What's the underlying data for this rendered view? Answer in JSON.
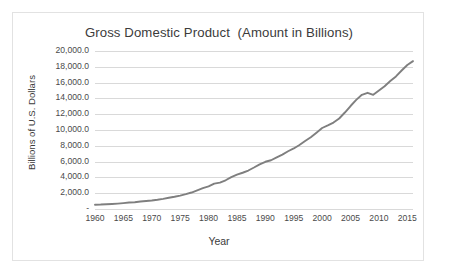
{
  "chart_data": {
    "type": "line",
    "title": "Gross Domestic Product  (Amount in Billions)",
    "xlabel": "Year",
    "ylabel": "Billions of U.S. Dollars",
    "grid": true,
    "legend": false,
    "xlim": [
      1960,
      2016
    ],
    "ylim": [
      0,
      20000
    ],
    "x_tick_labels": [
      "1960",
      "1965",
      "1970",
      "1975",
      "1980",
      "1985",
      "1990",
      "1995",
      "2000",
      "2005",
      "2010",
      "2015"
    ],
    "x_tick_values": [
      1960,
      1965,
      1970,
      1975,
      1980,
      1985,
      1990,
      1995,
      2000,
      2005,
      2010,
      2015
    ],
    "y_tick_labels": [
      "20,000.0",
      "18,000.0",
      "16,000.0",
      "14,000.0",
      "12,000.0",
      "10,000.0",
      "8,000.0",
      "6,000.0",
      "4,000.0",
      "2,000.0",
      "-"
    ],
    "y_tick_values": [
      20000,
      18000,
      16000,
      14000,
      12000,
      10000,
      8000,
      6000,
      4000,
      2000,
      0
    ],
    "series": [
      {
        "name": "Gross Domestic Product",
        "color": "#7f7f7f",
        "x": [
          1960,
          1961,
          1962,
          1963,
          1964,
          1965,
          1966,
          1967,
          1968,
          1969,
          1970,
          1971,
          1972,
          1973,
          1974,
          1975,
          1976,
          1977,
          1978,
          1979,
          1980,
          1981,
          1982,
          1983,
          1984,
          1985,
          1986,
          1987,
          1988,
          1989,
          1990,
          1991,
          1992,
          1993,
          1994,
          1995,
          1996,
          1997,
          1998,
          1999,
          2000,
          2001,
          2002,
          2003,
          2004,
          2005,
          2006,
          2007,
          2008,
          2009,
          2010,
          2011,
          2012,
          2013,
          2014,
          2015,
          2016
        ],
        "values": [
          543.3,
          563.3,
          605.1,
          638.6,
          685.8,
          743.7,
          815.0,
          861.7,
          942.5,
          1019.9,
          1075.9,
          1167.8,
          1282.4,
          1428.5,
          1548.8,
          1688.9,
          1877.6,
          2086.0,
          2356.6,
          2632.1,
          2862.5,
          3211.0,
          3345.0,
          3638.1,
          4040.7,
          4346.7,
          4590.2,
          4870.2,
          5252.6,
          5657.7,
          5979.6,
          6174.0,
          6539.3,
          6878.7,
          7308.8,
          7664.1,
          8100.2,
          8608.5,
          9089.2,
          9660.6,
          10252.3,
          10581.8,
          10936.4,
          11458.2,
          12213.7,
          13036.6,
          13814.6,
          14451.9,
          14712.8,
          14448.9,
          14992.1,
          15542.6,
          16197.0,
          16784.9,
          17527.3,
          18224.8,
          18715.0
        ]
      }
    ]
  }
}
